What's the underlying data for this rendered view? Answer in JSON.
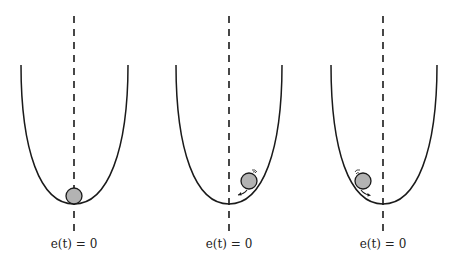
{
  "figure": {
    "colors": {
      "curve": "#1a1a1a",
      "dash": "#1a1a1a",
      "ball_fill": "#b3b3b3",
      "ball_stroke": "#1a1a1a"
    },
    "panels": [
      {
        "id": "panel-1",
        "label": "e(t) = 0",
        "ball_state": "at-rest-bottom",
        "motion_arrow": "none"
      },
      {
        "id": "panel-2",
        "label": "e(t) = 0",
        "ball_state": "right-side",
        "motion_arrow": "rolling-down-left"
      },
      {
        "id": "panel-3",
        "label": "e(t) = 0",
        "ball_state": "left-side",
        "motion_arrow": "rolling-down-right"
      }
    ]
  }
}
